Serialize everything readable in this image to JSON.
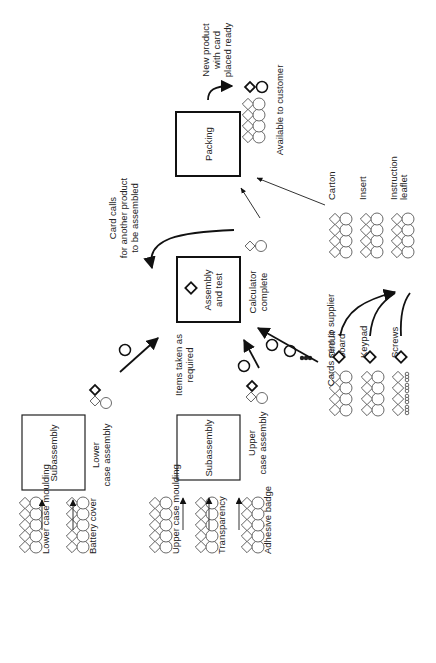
{
  "diagram": {
    "orientation": "rotated-90-ccw",
    "processes": [
      {
        "id": "subassembly_lower",
        "label": "Subassembly",
        "x": 22,
        "y": 415,
        "w": 63,
        "h": 75,
        "bold": false
      },
      {
        "id": "subassembly_upper",
        "label": "Subassembly",
        "x": 177,
        "y": 415,
        "w": 63,
        "h": 65,
        "bold": false
      },
      {
        "id": "assembly_test",
        "label": "Assembly\nand test",
        "line1": "Assembly",
        "line2": "and test",
        "x": 177,
        "y": 257,
        "w": 63,
        "h": 65,
        "bold": true
      },
      {
        "id": "packing",
        "label": "Packing",
        "x": 176,
        "y": 112,
        "w": 64,
        "h": 64,
        "bold": true
      }
    ],
    "stocks": [
      {
        "id": "lower_case_moulding",
        "label": "Lower case moulding",
        "x": 25,
        "y": 547,
        "cols": 5,
        "kind": "diamond-circle"
      },
      {
        "id": "battery_cover",
        "label": "Battery cover",
        "x": 72,
        "y": 547,
        "cols": 5,
        "kind": "diamond-circle"
      },
      {
        "id": "upper_case_moulding",
        "label": "Upper case moulding",
        "x": 155,
        "y": 547,
        "cols": 5,
        "kind": "diamond-circle"
      },
      {
        "id": "transparency",
        "label": "Transparency",
        "x": 201,
        "y": 547,
        "cols": 5,
        "kind": "diamond-circle"
      },
      {
        "id": "adhesive_badge",
        "label": "Adhesive badge",
        "x": 247,
        "y": 547,
        "cols": 5,
        "kind": "diamond-circle"
      },
      {
        "id": "circuit_board",
        "label": "Circuit\nboard",
        "line1": "Circuit",
        "line2": "board",
        "x": 335,
        "y": 410,
        "cols": 4,
        "kind": "diamond-circle"
      },
      {
        "id": "keypad",
        "label": "Keypad",
        "x": 367,
        "y": 410,
        "cols": 4,
        "kind": "diamond-circle"
      },
      {
        "id": "screws",
        "label": "Screws",
        "x": 398,
        "y": 410,
        "cols": 4,
        "kind": "diamond-screws"
      },
      {
        "id": "carton",
        "label": "Carton",
        "x": 335,
        "y": 252,
        "cols": 4,
        "kind": "diamond-circle"
      },
      {
        "id": "insert",
        "label": "Insert",
        "x": 366,
        "y": 252,
        "cols": 4,
        "kind": "diamond-circle"
      },
      {
        "id": "instruction_leaflet",
        "label": "Instruction\nleaflet",
        "line1": "Instruction",
        "line2": "leaflet",
        "x": 397,
        "y": 252,
        "cols": 4,
        "kind": "diamond-circle"
      },
      {
        "id": "available_to_customer",
        "label": "Available to customer",
        "x": 248,
        "y": 137,
        "cols": 4,
        "kind": "diamond-circle"
      }
    ],
    "annotations": {
      "lower_case_assembly": {
        "line1": "Lower",
        "line2": "case assembly"
      },
      "upper_case_assembly": {
        "line1": "Upper",
        "line2": "case assembly"
      },
      "items_taken": {
        "line1": "Items taken as",
        "line2": "required"
      },
      "calculator_complete": {
        "line1": "Calculator",
        "line2": "complete"
      },
      "card_calls": {
        "line1": "Card calls",
        "line2": "for another product",
        "line3": "to be assembled"
      },
      "cards_sent": {
        "text": "Cards sent to supplier"
      },
      "new_product": {
        "line1": "New product",
        "line2": "with card",
        "line3": "placed ready"
      }
    },
    "colors": {
      "line": "#222222",
      "background": "#ffffff"
    }
  }
}
